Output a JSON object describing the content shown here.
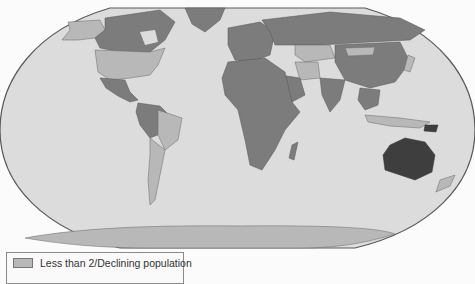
{
  "map": {
    "projection": "Robinson (world)",
    "colors": {
      "ocean": "#dcdcdc",
      "outline": "#5a5a5a",
      "low_fertility": "#b8b8b8",
      "mid_fertility": "#7c7c7c",
      "high_fertility": "#3e3e3e",
      "antarctica": "#b8b8b8"
    }
  },
  "legend": {
    "items": [
      {
        "label": "Less than 2/Declining population",
        "color": "#b8b8b8"
      }
    ]
  }
}
